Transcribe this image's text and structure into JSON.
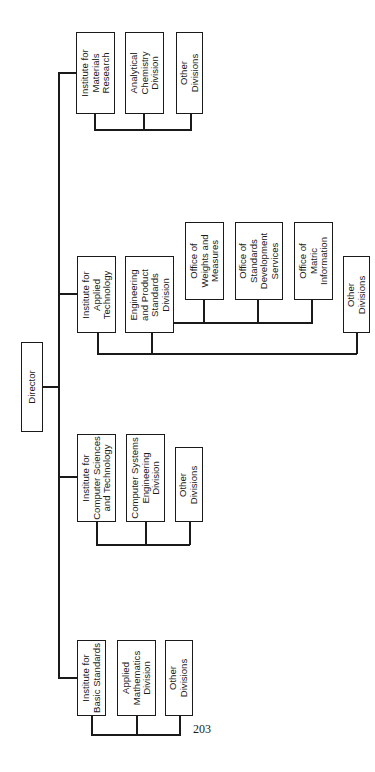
{
  "diagram": {
    "type": "organization-chart",
    "orientation": "rotated-90-ccw",
    "root": {
      "label": "Director"
    },
    "institutes": [
      {
        "label": "Institute for\nMaterials\nResearch",
        "divisions": [
          {
            "label": "Analytical\nChemistry\nDivision"
          },
          {
            "label": "Other\nDivisions"
          }
        ]
      },
      {
        "label": "Institute for\nApplied\nTechnology",
        "divisions": [
          {
            "label": "Engineering\nand Product\nStandards\nDivision",
            "offices": [
              {
                "label": "Office of\nWeights and\nMeasures"
              },
              {
                "label": "Office of\nStandards\nDevelopment\nServices"
              },
              {
                "label": "Office of\nMatric\nInformation"
              }
            ]
          },
          {
            "label": "Other\nDivisions"
          }
        ]
      },
      {
        "label": "Institute for\nComputer Sciences\nand Technology",
        "divisions": [
          {
            "label": "Computer Systems\nEngineering\nDivision"
          },
          {
            "label": "Other\nDivisions"
          }
        ]
      },
      {
        "label": "Institute for\nBasic Standards",
        "divisions": [
          {
            "label": "Applied\nMathematics\nDivision"
          },
          {
            "label": "Other\nDivisions"
          }
        ]
      }
    ]
  },
  "page_number": "203",
  "colors": {
    "line": "#1a1a1a",
    "background": "#ffffff"
  }
}
